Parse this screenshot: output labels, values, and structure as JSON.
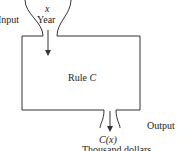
{
  "diagram": {
    "input_label": "Input",
    "input_var": "x",
    "input_unit": "Year",
    "rule_prefix": "Rule ",
    "rule_name": "C",
    "output_label": "Output",
    "output_expr": "C(x)",
    "output_unit": "Thousand dollars"
  }
}
